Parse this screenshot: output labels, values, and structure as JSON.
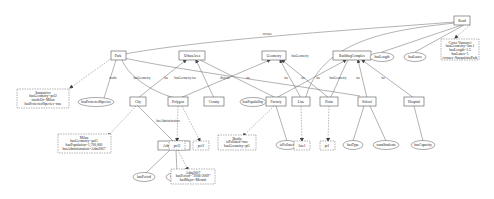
{
  "diagram": {
    "classes": [
      {
        "id": "road",
        "label": "Road",
        "x": 462,
        "y": 21
      },
      {
        "id": "park",
        "label": "Park",
        "x": 118,
        "y": 56
      },
      {
        "id": "urbanarea",
        "label": "UrbanArea",
        "x": 192,
        "y": 56
      },
      {
        "id": "geometry",
        "label": "Geometry",
        "x": 274,
        "y": 56
      },
      {
        "id": "buildingcomplex",
        "label": "BuildingComplex",
        "x": 352,
        "y": 56
      },
      {
        "id": "city",
        "label": "City",
        "x": 138,
        "y": 102
      },
      {
        "id": "polygon",
        "label": "Polygon",
        "x": 178,
        "y": 102
      },
      {
        "id": "county",
        "label": "County",
        "x": 214,
        "y": 102
      },
      {
        "id": "factory",
        "label": "Factory",
        "x": 276,
        "y": 102
      },
      {
        "id": "line",
        "label": "Line",
        "x": 301,
        "y": 102
      },
      {
        "id": "point",
        "label": "Point",
        "x": 329,
        "y": 102
      },
      {
        "id": "school",
        "label": "School",
        "x": 367,
        "y": 102
      },
      {
        "id": "hospital",
        "label": "Hospital",
        "x": 414,
        "y": 102
      },
      {
        "id": "administration",
        "label": "Administration",
        "x": 174,
        "y": 146
      }
    ],
    "attributes": [
      {
        "id": "haslength",
        "label": "hasLength",
        "x": 382,
        "y": 57
      },
      {
        "id": "haslanes",
        "label": "hasLanes",
        "x": 415,
        "y": 57
      },
      {
        "id": "hasprotectedspecies",
        "label": "hasProtectedSpecies",
        "x": 88,
        "y": 102
      },
      {
        "id": "hasepopuladay",
        "label": "hasPopulaDay",
        "x": 253,
        "y": 102
      },
      {
        "id": "ispolluted",
        "label": "isPolluted",
        "x": 287,
        "y": 145
      },
      {
        "id": "hastype",
        "label": "hasType",
        "x": 353,
        "y": 145
      },
      {
        "id": "numstudents",
        "label": "numStudents",
        "x": 386,
        "y": 145
      },
      {
        "id": "hascapacity",
        "label": "hasCapacity",
        "x": 423,
        "y": 145
      },
      {
        "id": "hasperiod",
        "label": "hasPeriod",
        "x": 144,
        "y": 177
      },
      {
        "id": "hasmajor",
        "label": "hasMajor",
        "x": 177,
        "y": 177
      }
    ],
    "instances": [
      {
        "id": "corsovannucci",
        "lines": [
          "Corso Vannucci",
          "hasGeometry=line1",
          "hasLength=1.5",
          "hasLanes=1",
          "crosses=SanquirinoPark"
        ],
        "x": 460,
        "y": 48
      },
      {
        "id": "sanquirico",
        "lines": [
          "Sanquirico",
          "hasGeometry=pol2",
          "insideOf=Milan",
          "hasProtectedSpecies=true"
        ],
        "x": 42,
        "y": 100
      },
      {
        "id": "milan",
        "lines": [
          "Milan",
          "hasGeometry=pol1",
          "hasPopulation=1,700,000",
          "hasAdministration=Adm2007"
        ],
        "x": 95,
        "y": 146
      },
      {
        "id": "adm2007",
        "lines": [
          "Adm2007",
          "hasPeriod=\"2006-2009\"",
          "hasMajor=Moratti"
        ],
        "x": 193,
        "y": 178
      },
      {
        "id": "basf",
        "lines": [
          "Basfla",
          "isPolluted=true",
          "hasGeometry=pt1"
        ],
        "x": 237,
        "y": 143
      },
      {
        "id": "pol2",
        "lines": [
          "pol2"
        ],
        "x": 177,
        "y": 145
      },
      {
        "id": "pol1",
        "lines": [
          "pol1"
        ],
        "x": 201,
        "y": 145
      },
      {
        "id": "line1",
        "lines": [
          "line1"
        ],
        "x": 302,
        "y": 145
      },
      {
        "id": "pt1",
        "lines": [
          "pt1"
        ],
        "x": 327,
        "y": 145
      }
    ],
    "edge_labels": [
      {
        "label": "crosses",
        "x": 267,
        "y": 35
      },
      {
        "label": "inside",
        "x": 113,
        "y": 79
      },
      {
        "label": "hasGeometry",
        "x": 142,
        "y": 79
      },
      {
        "label": "isa",
        "x": 166,
        "y": 79
      },
      {
        "label": "hasGeometry isa",
        "x": 185,
        "y": 79
      },
      {
        "label": "disjoint",
        "x": 225,
        "y": 79
      },
      {
        "label": "isa",
        "x": 248,
        "y": 79
      },
      {
        "label": "hasGeometry",
        "x": 300,
        "y": 56
      },
      {
        "label": "isa",
        "x": 286,
        "y": 79
      },
      {
        "label": "isa",
        "x": 303,
        "y": 79
      },
      {
        "label": "isa",
        "x": 318,
        "y": 79
      },
      {
        "label": "hasGeometry",
        "x": 338,
        "y": 79
      },
      {
        "label": "isa",
        "x": 358,
        "y": 79
      },
      {
        "label": "isa",
        "x": 383,
        "y": 79
      },
      {
        "label": "hasAdministration",
        "x": 168,
        "y": 122
      }
    ]
  }
}
